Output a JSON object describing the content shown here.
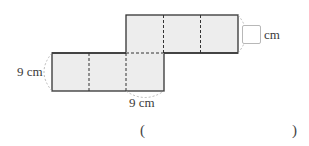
{
  "diagram": {
    "type": "net-of-rectangular-prism",
    "face_fill": "#ededed",
    "edge_color": "#333333",
    "fold_line_style": "dashed",
    "labels": {
      "left_height": "9 cm",
      "bottom_width": "9 cm",
      "unknown_unit": "cm"
    }
  },
  "answer": {
    "open_paren": "(",
    "close_paren": ")",
    "value": ""
  }
}
